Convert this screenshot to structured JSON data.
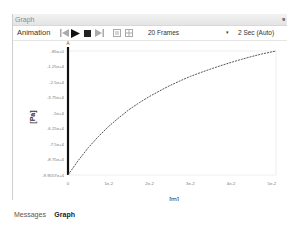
{
  "panel": {
    "title": "Graph",
    "pin_glyph": "ᵍ"
  },
  "toolbar": {
    "label": "Animation",
    "frames": "20 Frames",
    "dropdown_glyph": "▾",
    "speed": "2 Sec (Auto)",
    "icons": [
      "first-frame-icon",
      "play-icon",
      "stop-icon",
      "last-frame-icon",
      "export-frames-icon",
      "settings-frames-icon"
    ]
  },
  "tabs": [
    {
      "label": "Messages",
      "active": false
    },
    {
      "label": "Graph",
      "active": true
    }
  ],
  "chart_data": {
    "type": "line",
    "title": "",
    "xlabel": "[m]",
    "ylabel": "[Pa]",
    "x_ticks": [
      "0",
      "1e-2",
      "2e-2",
      "3e-2",
      "4e-2",
      "5e-2"
    ],
    "y_ticks": [
      "-85e+0",
      "-1.25e+4",
      "-2.5e+4",
      "-3.75e+4",
      "-5e+4",
      "-6.25e+4",
      "-7.5e+4",
      "-8.75e+4",
      "-9.9557e+4"
    ],
    "xlim": [
      0,
      0.051
    ],
    "ylim": [
      -99557,
      -85
    ],
    "grid": false,
    "marker_label": "A",
    "series": [
      {
        "name": "Pressure",
        "x": [
          0,
          0.0025,
          0.005,
          0.0075,
          0.01,
          0.0125,
          0.015,
          0.0175,
          0.02,
          0.0225,
          0.025,
          0.0275,
          0.03,
          0.0325,
          0.035,
          0.0375,
          0.04,
          0.0425,
          0.045,
          0.0475,
          0.051
        ],
        "y": [
          -99557,
          -88000,
          -77500,
          -68500,
          -60500,
          -53500,
          -47000,
          -41500,
          -36500,
          -32000,
          -27800,
          -24000,
          -20500,
          -17400,
          -14500,
          -11800,
          -9200,
          -6800,
          -4600,
          -2500,
          -85
        ]
      }
    ]
  }
}
